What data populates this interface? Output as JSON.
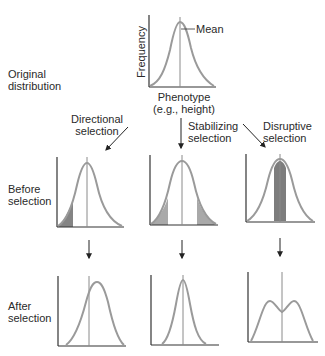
{
  "original": {
    "row_label": [
      "Original",
      "distribution"
    ],
    "y_axis_label": "Frequency",
    "x_axis_label": [
      "Phenotype",
      "(e.g., height)"
    ],
    "mean_label": "Mean"
  },
  "selection_types": [
    {
      "label": [
        "Directional",
        "selection"
      ]
    },
    {
      "label": [
        "Stabilizing",
        "selection"
      ]
    },
    {
      "label": [
        "Disruptive",
        "selection"
      ]
    }
  ],
  "rows": {
    "before": [
      "Before",
      "selection"
    ],
    "after": [
      "After",
      "selection"
    ]
  },
  "colors": {
    "curve": "#9a9a9a",
    "axis": "#333333",
    "mean_line": "#8a8a8a",
    "shade_light": "#a9a9a9",
    "shade_dark": "#6f6f6f",
    "arrow": "#222222"
  }
}
